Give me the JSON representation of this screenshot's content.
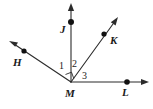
{
  "figure": {
    "background_color": "#ffffff",
    "line_color": "#2b2b2b",
    "label_color": "#1a1a1a",
    "width": 153,
    "height": 109,
    "vertex": {
      "name": "M",
      "label": "M",
      "x": 71,
      "y": 82,
      "label_x": 67,
      "label_y": 96
    },
    "rays": [
      {
        "id": "ray-MH",
        "label": "H",
        "from_x": 71,
        "from_y": 82,
        "to_x": 9,
        "to_y": 41,
        "point_x": 24,
        "point_y": 51,
        "label_x": 13,
        "label_y": 66,
        "has_arrowhead": true,
        "has_point_dot": true
      },
      {
        "id": "ray-MJ",
        "label": "J",
        "from_x": 71,
        "from_y": 82,
        "to_x": 71,
        "to_y": 4,
        "point_x": 71,
        "point_y": 22,
        "label_x": 60,
        "label_y": 33,
        "has_arrowhead": true,
        "has_point_dot": true
      },
      {
        "id": "ray-MK",
        "label": "K",
        "from_x": 71,
        "from_y": 82,
        "to_x": 118,
        "to_y": 17,
        "point_x": 104,
        "point_y": 34,
        "label_x": 110,
        "label_y": 44,
        "has_arrowhead": true,
        "has_point_dot": true
      },
      {
        "id": "ray-ML",
        "label": "L",
        "from_x": 71,
        "from_y": 82,
        "to_x": 149,
        "to_y": 82,
        "point_x": 127,
        "point_y": 82,
        "label_x": 122,
        "label_y": 96,
        "has_arrowhead": true,
        "has_point_dot": true
      }
    ],
    "angles": [
      {
        "id": "angle-1",
        "label": "1",
        "between": "MH and MJ",
        "label_x": 60,
        "label_y": 68,
        "marked_right_angle": true
      },
      {
        "id": "angle-2",
        "label": "2",
        "between": "MJ and MK",
        "label_x": 73,
        "label_y": 67,
        "marked_right_angle": false
      },
      {
        "id": "angle-3",
        "label": "3",
        "between": "MK and ML",
        "label_x": 83,
        "label_y": 78,
        "marked_right_angle": false
      }
    ],
    "right_angle_marker": {
      "id": "right-angle-marker",
      "description": "small square at vertex M indicating a right angle between ray MH and ray MJ",
      "points": "65,74 71,72 73,79"
    }
  }
}
